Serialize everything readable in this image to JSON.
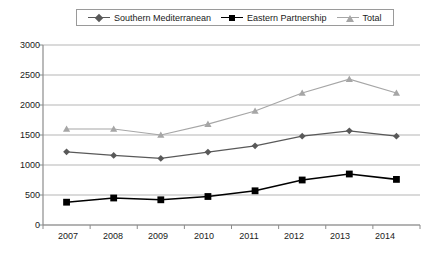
{
  "chart_data": {
    "type": "line",
    "title": "",
    "subtitle": "",
    "xlabel": "",
    "ylabel": "",
    "categories": [
      "2007",
      "2008",
      "2009",
      "2010",
      "2011",
      "2012",
      "2013",
      "2014"
    ],
    "x": [
      2007,
      2008,
      2009,
      2010,
      2011,
      2012,
      2013,
      2014
    ],
    "ylim": [
      0,
      3000
    ],
    "yticks": [
      0,
      500,
      1000,
      1500,
      2000,
      2500,
      3000
    ],
    "ytick_labels": [
      "0",
      "500",
      "1000",
      "1500",
      "2000",
      "2500",
      "3000"
    ],
    "grid": true,
    "grid_axis": "y",
    "legend_position": "top-center",
    "series": [
      {
        "name": "Southern Mediterranean",
        "marker": "diamond",
        "color": "#595959",
        "line_color": "#595959",
        "values": [
          1220,
          1160,
          1110,
          1215,
          1320,
          1480,
          1570,
          1480
        ]
      },
      {
        "name": "Eastern Partnership",
        "marker": "square",
        "color": "#000000",
        "line_color": "#000000",
        "values": [
          380,
          450,
          420,
          475,
          570,
          750,
          850,
          760
        ]
      },
      {
        "name": "Total",
        "marker": "triangle",
        "color": "#a6a6a6",
        "line_color": "#a6a6a6",
        "values": [
          1600,
          1600,
          1500,
          1680,
          1900,
          2200,
          2430,
          2200
        ]
      }
    ]
  },
  "legend": {
    "entries": [
      {
        "label": "Southern Mediterranean",
        "marker": "diamond-icon",
        "color": "#595959"
      },
      {
        "label": "Eastern Partnership",
        "marker": "square-icon",
        "color": "#000000"
      },
      {
        "label": "Total",
        "marker": "triangle-icon",
        "color": "#a6a6a6"
      }
    ]
  },
  "axes": {
    "y_tick_labels": [
      "3000",
      "2500",
      "2000",
      "1500",
      "1000",
      "500",
      "0"
    ],
    "x_tick_labels": [
      "2007",
      "2008",
      "2009",
      "2010",
      "2011",
      "2012",
      "2013",
      "2014"
    ]
  },
  "colors": {
    "southern_mediterranean": "#595959",
    "eastern_partnership": "#000000",
    "total": "#a6a6a6",
    "grid": "#b5b5b5",
    "axis": "#8c8c8c",
    "text": "#1a1a1a",
    "background": "#ffffff"
  }
}
